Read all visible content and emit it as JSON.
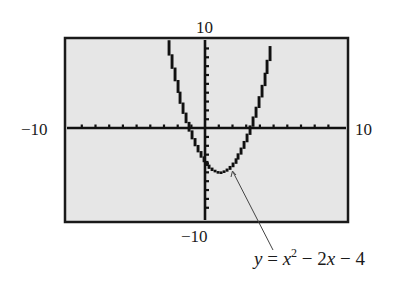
{
  "chart_data": {
    "type": "line",
    "title": "",
    "function": "y = x^2 - 2x - 4",
    "xlabel": "",
    "ylabel": "",
    "xlim": [
      -10,
      10
    ],
    "ylim": [
      -10,
      10
    ],
    "xscale": 1,
    "yscale": 1,
    "grid": false,
    "tick_marks": "every 1 unit on both axes",
    "series": [
      {
        "name": "y = x^2 - 2x - 4",
        "x": [
          -3.5,
          -3,
          -2,
          -1.236,
          -1,
          0,
          1,
          2,
          3,
          3.236,
          4,
          5,
          5.5
        ],
        "y": [
          15.25,
          11,
          4,
          0,
          -1,
          -4,
          -5,
          -4,
          -1,
          0,
          4,
          11,
          15.25
        ]
      }
    ],
    "vertex": [
      1,
      -5
    ],
    "y_intercept": -4,
    "roots": [
      -1.236,
      3.236
    ],
    "window_labels": {
      "ymax": "10",
      "ymin": "−10",
      "xmin": "−10",
      "xmax": "10"
    },
    "annotation": {
      "text": "y = x² − 2x − 4",
      "points_to": [
        1,
        -5
      ]
    }
  },
  "labels": {
    "ymax": "10",
    "ymin": "−10",
    "xmin": "−10",
    "xmax": "10"
  },
  "equation": {
    "y": "y",
    "equals": " = ",
    "x": "x",
    "exp": "2",
    "minus1": " − ",
    "term2": "2",
    "x2": "x",
    "minus2": " − ",
    "const": "4"
  },
  "colors": {
    "screen": "#e6e6e6",
    "frame": "#1a1a1a",
    "curve": "#111111",
    "axis": "#111111",
    "leader": "#444444"
  }
}
